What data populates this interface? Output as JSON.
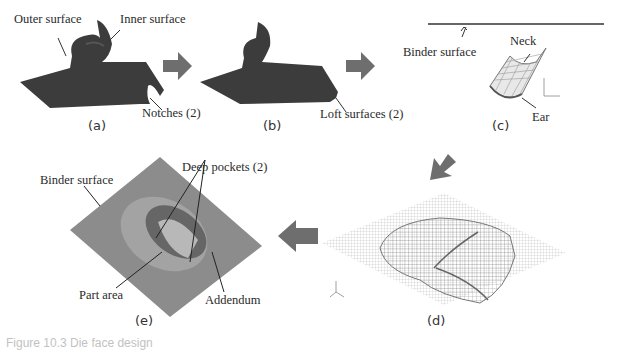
{
  "panels": {
    "a": {
      "caption": "(a)",
      "labels": {
        "outer": "Outer surface",
        "inner": "Inner surface",
        "notches": "Notches (2)"
      }
    },
    "b": {
      "caption": "(b)",
      "labels": {
        "loft": "Loft surfaces (2)"
      }
    },
    "c": {
      "caption": "(c)",
      "labels": {
        "binder": "Binder surface",
        "neck": "Neck",
        "ear": "Ear"
      },
      "axes": {
        "z": "z",
        "x": "x"
      }
    },
    "d": {
      "caption": "(d)"
    },
    "e": {
      "caption": "(e)",
      "labels": {
        "binder": "Binder surface",
        "pockets": "Deep pockets (2)",
        "part": "Part area",
        "addendum": "Addendum"
      }
    }
  },
  "colors": {
    "part": "#3c3c3c",
    "arrow": "#6e6e6e",
    "mesh": "#9a9a9a",
    "surface": "#8a8a8a"
  },
  "figure_caption": "Figure 10.3 Die face design"
}
